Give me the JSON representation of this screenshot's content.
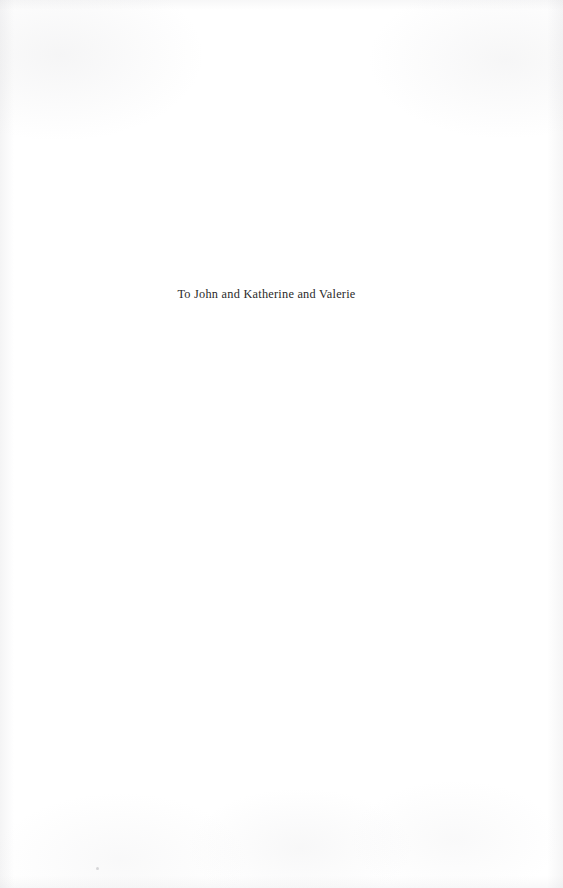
{
  "page": {
    "kind": "book-dedication-page",
    "background_color": "#ffffff",
    "text_color": "#2a2a2a"
  },
  "dedication": {
    "text": "To John and Katherine and Valerie"
  }
}
